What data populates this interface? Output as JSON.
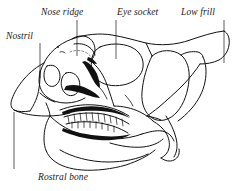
{
  "figure": {
    "style": "black ink line art on white",
    "ink_color": "#111111",
    "background_color": "#ffffff"
  },
  "labels": [
    {
      "id": "nose-ridge",
      "text": "Nose ridge",
      "position": "top-left-center",
      "leader": {
        "x": 77,
        "y_start": 20,
        "y_end": 56,
        "orientation": "vertical"
      }
    },
    {
      "id": "nostril",
      "text": "Nostril",
      "position": "upper-left",
      "leader": {
        "x": 40,
        "y_start": 43,
        "y_end": 78,
        "orientation": "vertical"
      }
    },
    {
      "id": "eye-socket",
      "text": "Eye socket",
      "position": "top-center-right",
      "leader": {
        "x": 116,
        "y_start": 20,
        "y_end": 59,
        "orientation": "vertical"
      }
    },
    {
      "id": "low-frill",
      "text": "Low frill",
      "position": "top-right",
      "leader": {
        "x": 224,
        "y_start": 20,
        "y_end": 63,
        "orientation": "vertical"
      }
    },
    {
      "id": "rostral-bone",
      "text": "Rostral bone",
      "position": "bottom-left",
      "leader": {
        "x": 14,
        "y_start": 112,
        "y_end": 169,
        "orientation": "vertical"
      }
    }
  ],
  "anatomy_parts": [
    "rostral bone",
    "nostril opening",
    "nose ridge",
    "antorbital fenestra",
    "eye socket (orbit)",
    "low frill",
    "upper tooth row",
    "lower tooth row",
    "lower jaw (dentary)",
    "jaw joint (quadrate)"
  ]
}
